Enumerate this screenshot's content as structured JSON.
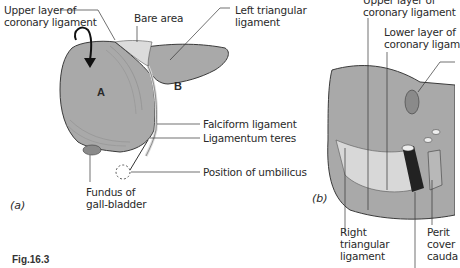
{
  "figure": {
    "caption": "Fig.16.3",
    "panels": {
      "a": {
        "label": "(a)",
        "regions": {
          "A": "A",
          "B": "B"
        },
        "labels": {
          "upper_layer_line1": "Upper layer of",
          "upper_layer_line2": "coronary ligament",
          "bare_area": "Bare area",
          "left_triangular_line1": "Left triangular",
          "left_triangular_line2": "ligament",
          "falciform": "Falciform ligament",
          "ligamentum_teres": "Ligamentum teres",
          "umbilicus": "Position of umbilicus",
          "fundus_line1": "Fundus of",
          "fundus_line2": "gall-bladder"
        }
      },
      "b": {
        "label": "(b)",
        "labels": {
          "upper_layer_line1": "Upper layer of",
          "upper_layer_line2": "coronary ligament",
          "lower_layer_line1": "Lower layer of",
          "lower_layer_line2": "coronary ligam",
          "right_triangular_line1": "Right",
          "right_triangular_line2": "triangular",
          "right_triangular_line3": "ligament",
          "peritoneum_line1": "Perit",
          "peritoneum_line2": "cover",
          "peritoneum_line3": "cauda"
        }
      }
    },
    "colors": {
      "liver": "#a9a9a9",
      "liver_dark": "#8f8f8f",
      "bare_area": "#dcdcdc",
      "outline": "#3a3a3a",
      "vena_cava": "#222222"
    }
  }
}
